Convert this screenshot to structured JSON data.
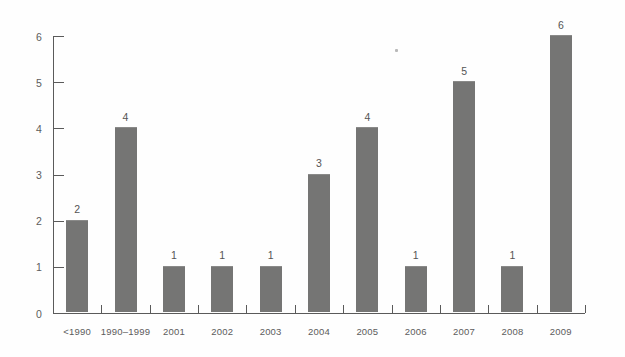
{
  "chart_data": {
    "type": "bar",
    "title": "",
    "subtitle": "",
    "xlabel": "",
    "ylabel": "",
    "categories": [
      "<1990",
      "1990–1999",
      "2001",
      "2002",
      "2003",
      "2004",
      "2005",
      "2006",
      "2007",
      "2008",
      "2009"
    ],
    "values": [
      2,
      4,
      1,
      1,
      1,
      3,
      4,
      1,
      5,
      1,
      6
    ],
    "data_labels": [
      "2",
      "4",
      "1",
      "1",
      "1",
      "3",
      "4",
      "1",
      "5",
      "1",
      "6"
    ],
    "ylim": [
      0,
      6
    ],
    "y_ticks": [
      0,
      1,
      2,
      3,
      4,
      5,
      6
    ],
    "y_tick_labels": [
      "0",
      "1",
      "2",
      "3",
      "4",
      "5",
      "6"
    ],
    "grid": false,
    "legend": null,
    "legend_position": "none",
    "bar_color": "#757574",
    "axis_color": "#5a5a5a",
    "text_color": "#5c5c5c",
    "background_color": "#ffffff",
    "annotations": []
  }
}
